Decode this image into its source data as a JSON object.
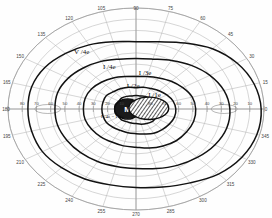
{
  "chart_data": {
    "type": "line",
    "subtitle": "Polar visual field plot with isopters, blind spot and scotoma",
    "xlabel": "",
    "ylabel": "",
    "grid": true,
    "legend_position": "in-plot annotations",
    "coordinate_system": "polar",
    "angle_unit": "degrees",
    "radius_unit": "degrees of eccentricity",
    "angle_range": [
      0,
      360
    ],
    "angle_step": 15,
    "radius_range": [
      0,
      90
    ],
    "radius_ticks": [
      10,
      20,
      30,
      40,
      50,
      60,
      70,
      80,
      90
    ],
    "angle_ticks": [
      "0",
      "15",
      "30",
      "45",
      "60",
      "75",
      "90",
      "105",
      "120",
      "135",
      "150",
      "165",
      "180",
      "195",
      "210",
      "225",
      "240",
      "255",
      "270",
      "285",
      "300",
      "315",
      "330",
      "345"
    ],
    "meridian_tick_labels_horizontal": [
      "80",
      "70",
      "60",
      "50",
      "40",
      "30",
      "20",
      "10",
      "10",
      "20",
      "30",
      "40",
      "50",
      "60",
      "70",
      "80"
    ],
    "series": [
      {
        "name": "V /4e",
        "label": "V /4e",
        "stimulus": "V4e",
        "kind": "isopter",
        "line_weight": "bold",
        "radii_by_angle": [
          {
            "angle": 0,
            "r": 88
          },
          {
            "angle": 15,
            "r": 86
          },
          {
            "angle": 30,
            "r": 82
          },
          {
            "angle": 45,
            "r": 76
          },
          {
            "angle": 60,
            "r": 68
          },
          {
            "angle": 75,
            "r": 62
          },
          {
            "angle": 90,
            "r": 60
          },
          {
            "angle": 105,
            "r": 62
          },
          {
            "angle": 120,
            "r": 66
          },
          {
            "angle": 135,
            "r": 70
          },
          {
            "angle": 150,
            "r": 74
          },
          {
            "angle": 165,
            "r": 76
          },
          {
            "angle": 180,
            "r": 76
          },
          {
            "angle": 195,
            "r": 76
          },
          {
            "angle": 210,
            "r": 76
          },
          {
            "angle": 225,
            "r": 74
          },
          {
            "angle": 240,
            "r": 72
          },
          {
            "angle": 255,
            "r": 70
          },
          {
            "angle": 270,
            "r": 70
          },
          {
            "angle": 285,
            "r": 72
          },
          {
            "angle": 300,
            "r": 76
          },
          {
            "angle": 315,
            "r": 82
          },
          {
            "angle": 330,
            "r": 86
          },
          {
            "angle": 345,
            "r": 88
          }
        ]
      },
      {
        "name": "I /4e",
        "label": "I /4e",
        "stimulus": "I4e",
        "kind": "isopter",
        "line_weight": "bold",
        "radii_by_angle": [
          {
            "angle": 0,
            "r": 66
          },
          {
            "angle": 15,
            "r": 64
          },
          {
            "angle": 30,
            "r": 60
          },
          {
            "angle": 45,
            "r": 55
          },
          {
            "angle": 60,
            "r": 50
          },
          {
            "angle": 75,
            "r": 46
          },
          {
            "angle": 90,
            "r": 45
          },
          {
            "angle": 105,
            "r": 46
          },
          {
            "angle": 120,
            "r": 49
          },
          {
            "angle": 135,
            "r": 52
          },
          {
            "angle": 150,
            "r": 55
          },
          {
            "angle": 165,
            "r": 57
          },
          {
            "angle": 180,
            "r": 57
          },
          {
            "angle": 195,
            "r": 57
          },
          {
            "angle": 210,
            "r": 56
          },
          {
            "angle": 225,
            "r": 55
          },
          {
            "angle": 240,
            "r": 54
          },
          {
            "angle": 255,
            "r": 53
          },
          {
            "angle": 270,
            "r": 53
          },
          {
            "angle": 285,
            "r": 55
          },
          {
            "angle": 300,
            "r": 58
          },
          {
            "angle": 315,
            "r": 61
          },
          {
            "angle": 330,
            "r": 64
          },
          {
            "angle": 345,
            "r": 66
          }
        ]
      },
      {
        "name": "I /3e",
        "label": "I /3e",
        "stimulus": "I3e",
        "kind": "isopter",
        "line_weight": "bold",
        "radii_by_angle": [
          {
            "angle": 0,
            "r": 42
          },
          {
            "angle": 15,
            "r": 41
          },
          {
            "angle": 30,
            "r": 38
          },
          {
            "angle": 45,
            "r": 35
          },
          {
            "angle": 60,
            "r": 32
          },
          {
            "angle": 75,
            "r": 30
          },
          {
            "angle": 90,
            "r": 29
          },
          {
            "angle": 105,
            "r": 30
          },
          {
            "angle": 120,
            "r": 32
          },
          {
            "angle": 135,
            "r": 34
          },
          {
            "angle": 150,
            "r": 36
          },
          {
            "angle": 165,
            "r": 37
          },
          {
            "angle": 180,
            "r": 37
          },
          {
            "angle": 195,
            "r": 37
          },
          {
            "angle": 210,
            "r": 36
          },
          {
            "angle": 225,
            "r": 35
          },
          {
            "angle": 240,
            "r": 34
          },
          {
            "angle": 255,
            "r": 34
          },
          {
            "angle": 270,
            "r": 34
          },
          {
            "angle": 285,
            "r": 36
          },
          {
            "angle": 300,
            "r": 38
          },
          {
            "angle": 315,
            "r": 40
          },
          {
            "angle": 330,
            "r": 41
          },
          {
            "angle": 345,
            "r": 42
          }
        ]
      },
      {
        "name": "I /2e",
        "label": "I /2e",
        "stimulus": "I2e",
        "kind": "isopter",
        "line_weight": "bold",
        "radii_by_angle": [
          {
            "angle": 0,
            "r": 28
          },
          {
            "angle": 15,
            "r": 27
          },
          {
            "angle": 30,
            "r": 25
          },
          {
            "angle": 45,
            "r": 23
          },
          {
            "angle": 60,
            "r": 21
          },
          {
            "angle": 75,
            "r": 20
          },
          {
            "angle": 90,
            "r": 19
          },
          {
            "angle": 105,
            "r": 20
          },
          {
            "angle": 120,
            "r": 21
          },
          {
            "angle": 135,
            "r": 22
          },
          {
            "angle": 150,
            "r": 24
          },
          {
            "angle": 165,
            "r": 24
          },
          {
            "angle": 180,
            "r": 24
          },
          {
            "angle": 195,
            "r": 24
          },
          {
            "angle": 210,
            "r": 24
          },
          {
            "angle": 225,
            "r": 23
          },
          {
            "angle": 240,
            "r": 22
          },
          {
            "angle": 255,
            "r": 22
          },
          {
            "angle": 270,
            "r": 22
          },
          {
            "angle": 285,
            "r": 23
          },
          {
            "angle": 300,
            "r": 25
          },
          {
            "angle": 315,
            "r": 26
          },
          {
            "angle": 330,
            "r": 27
          },
          {
            "angle": 345,
            "r": 28
          }
        ]
      },
      {
        "name": "I /1e",
        "label": "I /1e",
        "stimulus": "I1e",
        "kind": "isopter",
        "line_weight": "bold",
        "radii_by_angle": [
          {
            "angle": 0,
            "r": 17
          },
          {
            "angle": 15,
            "r": 16
          },
          {
            "angle": 30,
            "r": 15
          },
          {
            "angle": 45,
            "r": 14
          },
          {
            "angle": 60,
            "r": 13
          },
          {
            "angle": 75,
            "r": 12
          },
          {
            "angle": 90,
            "r": 12
          },
          {
            "angle": 105,
            "r": 12
          },
          {
            "angle": 120,
            "r": 13
          },
          {
            "angle": 135,
            "r": 14
          },
          {
            "angle": 150,
            "r": 14
          },
          {
            "angle": 165,
            "r": 15
          },
          {
            "angle": 180,
            "r": 15
          },
          {
            "angle": 195,
            "r": 15
          },
          {
            "angle": 210,
            "r": 14
          },
          {
            "angle": 225,
            "r": 14
          },
          {
            "angle": 240,
            "r": 13
          },
          {
            "angle": 255,
            "r": 13
          },
          {
            "angle": 270,
            "r": 13
          },
          {
            "angle": 285,
            "r": 14
          },
          {
            "angle": 300,
            "r": 15
          },
          {
            "angle": 315,
            "r": 16
          },
          {
            "angle": 330,
            "r": 16
          },
          {
            "angle": 345,
            "r": 17
          }
        ]
      }
    ],
    "annotations": [
      {
        "name": "v4e-label",
        "text": "V /4e",
        "angle": 128,
        "r": 62
      },
      {
        "name": "i4e-label",
        "text": "I /4e",
        "angle": 118,
        "r": 40
      },
      {
        "name": "i3e-label",
        "text": "I /3e",
        "angle": 78,
        "r": 31
      },
      {
        "name": "i2e-label",
        "text": "I /2e",
        "angle": 96,
        "r": 19
      },
      {
        "name": "i1e-label",
        "text": "I /1e",
        "angle": 40,
        "r": 17
      },
      {
        "name": "scotoma-label",
        "text": "I /4e = I /1e",
        "angle": 205,
        "r": 18
      }
    ],
    "markers": [
      {
        "name": "blind-spot",
        "label": "M",
        "shape": "filled-ellipse",
        "fill": "#1a1a1a",
        "angle": 180,
        "r": 6,
        "width_deg": 9,
        "height_deg": 9,
        "description": "Blind spot / fixation marker labelled M"
      },
      {
        "name": "scotoma",
        "label": "",
        "shape": "hatched-ellipse",
        "fill": "hatch",
        "angle": 4,
        "r": 9,
        "width_deg": 14,
        "height_deg": 10,
        "description": "Hatched relative scotoma area adjacent to blind spot"
      }
    ]
  },
  "colors": {
    "background": "#fefefe",
    "grid": "#9a9a9a",
    "grid_fine": "#b4b4b4",
    "isopter": "#121212",
    "label": "#444444",
    "marker_fill": "#1a1a1a",
    "frame": "#777777"
  },
  "chart": {
    "aria_title": "Goldmann visual field perimetry chart"
  }
}
